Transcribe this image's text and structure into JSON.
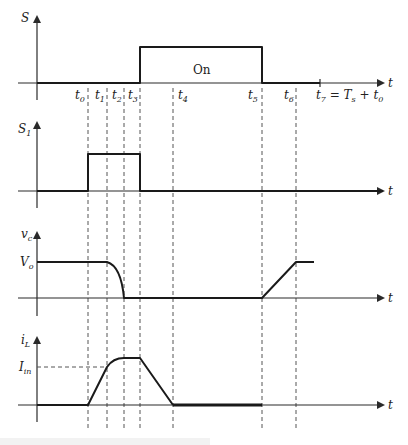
{
  "diagram": {
    "type": "timing-waveforms",
    "time_axis_label": "t",
    "time_markers": [
      {
        "id": "t0",
        "label": "t",
        "sub": "0",
        "x": 88
      },
      {
        "id": "t1",
        "label": "t",
        "sub": "1",
        "x": 107
      },
      {
        "id": "t2",
        "label": "t",
        "sub": "2",
        "x": 124
      },
      {
        "id": "t3",
        "label": "t",
        "sub": "3",
        "x": 140
      },
      {
        "id": "t4",
        "label": "t",
        "sub": "4",
        "x": 173
      },
      {
        "id": "t5",
        "label": "t",
        "sub": "5",
        "x": 262
      },
      {
        "id": "t6",
        "label": "t",
        "sub": "6",
        "x": 296
      },
      {
        "id": "t7",
        "label": "t",
        "sub": "7",
        "x": 320,
        "suffix": " = Tₛ + t₀"
      }
    ],
    "panels": [
      {
        "id": "S",
        "ylabel": "S",
        "ysub": "",
        "state_label": "On",
        "description": "Main switch gate signal: low until t3, high (On) from t3 to t5, low after t5"
      },
      {
        "id": "S1",
        "ylabel": "S",
        "ysub": "1",
        "description": "Auxiliary switch: high from t0 to t3"
      },
      {
        "id": "vc",
        "ylabel": "v",
        "ysub": "c",
        "level_label": "V",
        "level_sub": "o",
        "description": "Capacitor voltage: Vo until t1, falls to 0 by t2, 0 until t5, ramps up to Vo at t6"
      },
      {
        "id": "iL",
        "ylabel": "i",
        "ysub": "L",
        "level_label": "I",
        "level_sub": "in",
        "description": "Inductor current: ramps from t0, reaches Iin at t1, peaks by t2, flat to t3, falls to 0 at t4"
      }
    ],
    "caption": ""
  },
  "labels": {
    "t_axis": "t",
    "S": "S",
    "S1_main": "S",
    "S1_sub": "1",
    "vc_main": "v",
    "vc_sub": "c",
    "iL_main": "i",
    "iL_sub": "L",
    "Vo_main": "V",
    "Vo_sub": "o",
    "Iin_main": "I",
    "Iin_sub": "in",
    "On": "On",
    "t_main": "t",
    "t0_sub": "0",
    "t1_sub": "1",
    "t2_sub": "2",
    "t3_sub": "3",
    "t4_sub": "4",
    "t5_sub": "5",
    "t6_sub": "6",
    "t7_sub": "7",
    "t7_eq": " = T",
    "Ts_sub": "s",
    "t7_plus": " + t",
    "t7_plus_sub": "0"
  }
}
